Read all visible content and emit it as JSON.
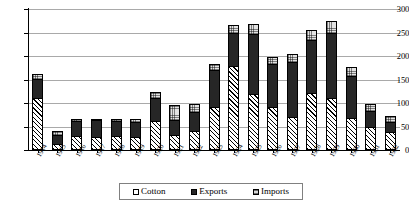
{
  "chart_data": {
    "type": "bar",
    "stacked": true,
    "title": "",
    "subtitle": "",
    "xlabel": "",
    "ylabel": "",
    "ylim": [
      0,
      300
    ],
    "yticks": [
      0,
      50,
      100,
      150,
      200,
      250,
      300
    ],
    "ytick_labels": [
      "0",
      "50",
      "100",
      "150",
      "200",
      "250",
      "300"
    ],
    "grid": true,
    "legend_position": "bottom-center",
    "categories": [
      "1914",
      "1915",
      "1916",
      "1917",
      "1918",
      "1919",
      "1920",
      "1921",
      "1922",
      "1923",
      "1924",
      "1925",
      "1926",
      "1927",
      "1928",
      "1929",
      "1930",
      "1931",
      "1932"
    ],
    "series": [
      {
        "name": "Cotton",
        "fill": "white-diagonal-hatch",
        "color": "#ffffff",
        "values": [
          110,
          12,
          30,
          28,
          30,
          28,
          62,
          32,
          40,
          92,
          178,
          120,
          92,
          70,
          122,
          110,
          68,
          50,
          38
        ]
      },
      {
        "name": "Exports",
        "fill": "solid-black",
        "color": "#262626",
        "values": [
          42,
          20,
          32,
          35,
          32,
          32,
          48,
          32,
          40,
          78,
          70,
          126,
          92,
          118,
          112,
          140,
          90,
          32,
          22
        ]
      },
      {
        "name": "Imports",
        "fill": "light-gray-dotted",
        "color": "#e2e2e2",
        "values": [
          10,
          8,
          4,
          4,
          4,
          5,
          14,
          32,
          18,
          14,
          18,
          22,
          14,
          16,
          22,
          25,
          18,
          16,
          12
        ]
      }
    ],
    "totals": [
      162,
      40,
      66,
      67,
      66,
      65,
      124,
      96,
      98,
      184,
      266,
      268,
      198,
      204,
      256,
      275,
      176,
      98,
      72
    ]
  },
  "legend": {
    "entries": [
      {
        "label": "Cotton"
      },
      {
        "label": "Exports"
      },
      {
        "label": "Imports"
      }
    ]
  }
}
